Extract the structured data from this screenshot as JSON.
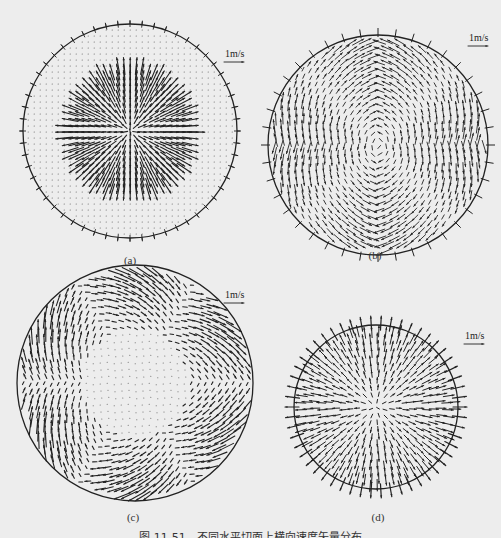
{
  "figure": {
    "caption": "图 11-51　不同水平切面上横向速度矢量分布",
    "background": "#ededed",
    "ink_color": "#222222",
    "panels": [
      {
        "id": "a",
        "label": "(a)",
        "scale_label": "1m/s",
        "cx": 130,
        "cy": 131,
        "r": 107,
        "pattern": "inner-radial-burst",
        "label_pos": [
          130,
          256
        ],
        "scale_pos": [
          224,
          52
        ]
      },
      {
        "id": "b",
        "label": "(b)",
        "scale_label": "1m/s",
        "cx": 378,
        "cy": 145,
        "r": 110,
        "pattern": "four-cell-swirl-outward-wall",
        "label_pos": [
          375,
          250
        ],
        "scale_pos": [
          469,
          35
        ]
      },
      {
        "id": "c",
        "label": "(c)",
        "scale_label": "1m/s",
        "cx": 135,
        "cy": 383,
        "r": 118,
        "pattern": "six-lobe-wall-jets",
        "label_pos": [
          133,
          512
        ],
        "scale_pos": [
          224,
          292
        ]
      },
      {
        "id": "d",
        "label": "(d)",
        "scale_label": "1m/s",
        "cx": 376,
        "cy": 407,
        "r": 82,
        "pattern": "full-radial-outflow",
        "label_pos": [
          378,
          512
        ],
        "scale_pos": [
          464,
          333
        ]
      }
    ]
  }
}
